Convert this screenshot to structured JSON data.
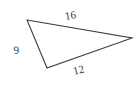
{
  "figure": {
    "type": "triangle-diagram",
    "background_color": "#ffffff",
    "stroke_color": "#3c3c3c",
    "label_color": "#3a3a3a",
    "stroke_width": 1.1,
    "vertices": {
      "top_left": {
        "x": 27,
        "y": 20
      },
      "right": {
        "x": 132,
        "y": 38
      },
      "bottom": {
        "x": 47,
        "y": 68
      }
    },
    "sides": [
      {
        "name": "top-side",
        "label": "16",
        "from": "top_left",
        "to": "right",
        "rotation_deg": -9
      },
      {
        "name": "left-side",
        "label": "9",
        "from": "top_left",
        "to": "bottom",
        "rotation_deg": -6
      },
      {
        "name": "bottom-side",
        "label": "12",
        "from": "bottom",
        "to": "right",
        "rotation_deg": -13
      }
    ]
  }
}
